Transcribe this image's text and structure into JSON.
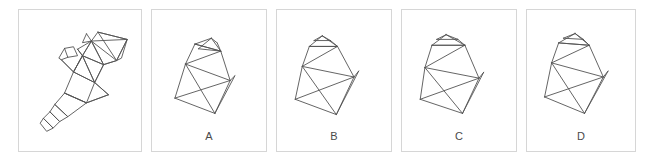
{
  "figure": {
    "kind": "spatial-reasoning-net-and-solids",
    "stroke_color": "#545454",
    "panel_border_color": "#d6d6d6",
    "background_color": "#ffffff",
    "label_color": "#4a4a4a"
  },
  "net_panel": {
    "name": "unfolded-net",
    "label": "",
    "description": "Unfolded net of a truncated pyramid with small cap, drawn as connected polygons"
  },
  "options": [
    {
      "id": "A",
      "label": "A",
      "shape": "frustum-with-cap",
      "orientation": "upright, cap tilted left, front-left face visible"
    },
    {
      "id": "B",
      "label": "B",
      "shape": "frustum-with-cap",
      "orientation": "tilted left, cap raised on top-left"
    },
    {
      "id": "C",
      "label": "C",
      "shape": "frustum-with-cap",
      "orientation": "upright, cap centered, rotated slightly"
    },
    {
      "id": "D",
      "label": "D",
      "shape": "frustum-with-cap",
      "orientation": "upright, cap tilted right, front-right face visible"
    }
  ],
  "net_geometry": {
    "stroke_width": 0.9,
    "polylines": [
      [
        [
          83,
          14
        ],
        [
          78,
          25
        ],
        [
          89,
          23
        ],
        [
          83,
          14
        ]
      ],
      [
        [
          89,
          23
        ],
        [
          97,
          12
        ],
        [
          133,
          21
        ],
        [
          89,
          23
        ]
      ],
      [
        [
          97,
          12
        ],
        [
          133,
          21
        ],
        [
          120,
          47
        ],
        [
          97,
          12
        ]
      ],
      [
        [
          133,
          21
        ],
        [
          120,
          47
        ],
        [
          126,
          44
        ],
        [
          133,
          21
        ]
      ],
      [
        [
          89,
          23
        ],
        [
          120,
          47
        ],
        [
          104,
          52
        ],
        [
          89,
          23
        ]
      ],
      [
        [
          89,
          23
        ],
        [
          104,
          52
        ],
        [
          78,
          41
        ],
        [
          89,
          23
        ]
      ],
      [
        [
          78,
          41
        ],
        [
          104,
          52
        ],
        [
          93,
          74
        ],
        [
          78,
          41
        ]
      ],
      [
        [
          78,
          41
        ],
        [
          93,
          74
        ],
        [
          67,
          61
        ],
        [
          78,
          41
        ]
      ],
      [
        [
          72,
          33
        ],
        [
          78,
          41
        ],
        [
          89,
          23
        ],
        [
          72,
          33
        ]
      ],
      [
        [
          56,
          32
        ],
        [
          67,
          30
        ],
        [
          72,
          41
        ],
        [
          60,
          43
        ],
        [
          56,
          32
        ]
      ],
      [
        [
          52,
          46
        ],
        [
          67,
          61
        ],
        [
          78,
          41
        ],
        [
          72,
          33
        ]
      ],
      [
        [
          60,
          43
        ],
        [
          52,
          46
        ],
        [
          49,
          44
        ],
        [
          56,
          32
        ]
      ],
      [
        [
          67,
          61
        ],
        [
          93,
          74
        ],
        [
          83,
          99
        ],
        [
          56,
          87
        ],
        [
          67,
          61
        ]
      ],
      [
        [
          56,
          87
        ],
        [
          83,
          99
        ],
        [
          110,
          89
        ],
        [
          93,
          74
        ]
      ],
      [
        [
          56,
          87
        ],
        [
          83,
          99
        ],
        [
          60,
          116
        ],
        [
          44,
          101
        ],
        [
          56,
          87
        ]
      ],
      [
        [
          44,
          101
        ],
        [
          60,
          116
        ],
        [
          50,
          122
        ],
        [
          38,
          110
        ],
        [
          44,
          101
        ]
      ],
      [
        [
          38,
          110
        ],
        [
          50,
          122
        ],
        [
          42,
          130
        ],
        [
          30,
          118
        ],
        [
          38,
          110
        ]
      ],
      [
        [
          30,
          118
        ],
        [
          42,
          130
        ],
        [
          34,
          134
        ],
        [
          26,
          124
        ],
        [
          30,
          118
        ]
      ],
      [
        [
          52,
          46
        ],
        [
          67,
          61
        ]
      ],
      [
        [
          67,
          61
        ],
        [
          78,
          41
        ]
      ],
      [
        [
          93,
          74
        ],
        [
          104,
          52
        ]
      ],
      [
        [
          104,
          52
        ],
        [
          120,
          47
        ]
      ],
      [
        [
          110,
          89
        ],
        [
          93,
          74
        ]
      ],
      [
        [
          83,
          99
        ],
        [
          110,
          89
        ]
      ]
    ]
  },
  "solid_geometry": {
    "stroke_width": 0.9,
    "A": {
      "lines": [
        [
          [
            25,
            46
          ],
          [
            16,
            75
          ]
        ],
        [
          [
            16,
            75
          ],
          [
            50,
            88
          ]
        ],
        [
          [
            50,
            88
          ],
          [
            63,
            60
          ]
        ],
        [
          [
            63,
            60
          ],
          [
            25,
            46
          ]
        ],
        [
          [
            25,
            46
          ],
          [
            50,
            88
          ]
        ],
        [
          [
            16,
            75
          ],
          [
            63,
            60
          ]
        ],
        [
          [
            25,
            46
          ],
          [
            33,
            29
          ]
        ],
        [
          [
            33,
            29
          ],
          [
            55,
            35
          ]
        ],
        [
          [
            55,
            35
          ],
          [
            63,
            60
          ]
        ],
        [
          [
            33,
            29
          ],
          [
            47,
            24
          ]
        ],
        [
          [
            47,
            24
          ],
          [
            55,
            35
          ]
        ],
        [
          [
            33,
            29
          ],
          [
            55,
            35
          ]
        ],
        [
          [
            36,
            33
          ],
          [
            47,
            24
          ]
        ],
        [
          [
            25,
            46
          ],
          [
            55,
            35
          ]
        ],
        [
          [
            36,
            33
          ],
          [
            55,
            35
          ]
        ],
        [
          [
            63,
            60
          ],
          [
            67,
            56
          ]
        ],
        [
          [
            50,
            88
          ],
          [
            67,
            56
          ]
        ],
        [
          [
            47,
            24
          ],
          [
            52,
            28
          ]
        ],
        [
          [
            52,
            28
          ],
          [
            55,
            35
          ]
        ]
      ]
    },
    "B": {
      "lines": [
        [
          [
            18,
            48
          ],
          [
            12,
            76
          ]
        ],
        [
          [
            12,
            76
          ],
          [
            47,
            89
          ]
        ],
        [
          [
            47,
            89
          ],
          [
            62,
            57
          ]
        ],
        [
          [
            62,
            57
          ],
          [
            18,
            48
          ]
        ],
        [
          [
            18,
            48
          ],
          [
            47,
            89
          ]
        ],
        [
          [
            12,
            76
          ],
          [
            62,
            57
          ]
        ],
        [
          [
            18,
            48
          ],
          [
            24,
            31
          ]
        ],
        [
          [
            24,
            31
          ],
          [
            48,
            31
          ]
        ],
        [
          [
            48,
            31
          ],
          [
            62,
            57
          ]
        ],
        [
          [
            24,
            31
          ],
          [
            35,
            22
          ]
        ],
        [
          [
            35,
            22
          ],
          [
            48,
            31
          ]
        ],
        [
          [
            24,
            31
          ],
          [
            48,
            31
          ]
        ],
        [
          [
            28,
            26
          ],
          [
            35,
            22
          ]
        ],
        [
          [
            18,
            48
          ],
          [
            48,
            31
          ]
        ],
        [
          [
            62,
            57
          ],
          [
            66,
            52
          ]
        ],
        [
          [
            47,
            89
          ],
          [
            66,
            52
          ]
        ],
        [
          [
            35,
            22
          ],
          [
            42,
            26
          ]
        ],
        [
          [
            42,
            26
          ],
          [
            48,
            31
          ]
        ],
        [
          [
            28,
            26
          ],
          [
            42,
            26
          ]
        ]
      ]
    },
    "C": {
      "lines": [
        [
          [
            16,
            49
          ],
          [
            12,
            76
          ]
        ],
        [
          [
            12,
            76
          ],
          [
            48,
            88
          ]
        ],
        [
          [
            48,
            88
          ],
          [
            62,
            58
          ]
        ],
        [
          [
            62,
            58
          ],
          [
            16,
            49
          ]
        ],
        [
          [
            16,
            49
          ],
          [
            48,
            88
          ]
        ],
        [
          [
            12,
            76
          ],
          [
            62,
            58
          ]
        ],
        [
          [
            16,
            49
          ],
          [
            22,
            30
          ]
        ],
        [
          [
            22,
            30
          ],
          [
            50,
            30
          ]
        ],
        [
          [
            50,
            30
          ],
          [
            62,
            58
          ]
        ],
        [
          [
            22,
            30
          ],
          [
            34,
            21
          ]
        ],
        [
          [
            34,
            21
          ],
          [
            50,
            30
          ]
        ],
        [
          [
            22,
            30
          ],
          [
            50,
            30
          ]
        ],
        [
          [
            16,
            49
          ],
          [
            50,
            30
          ]
        ],
        [
          [
            26,
            25
          ],
          [
            34,
            21
          ]
        ],
        [
          [
            62,
            58
          ],
          [
            66,
            53
          ]
        ],
        [
          [
            48,
            88
          ],
          [
            66,
            53
          ]
        ],
        [
          [
            34,
            21
          ],
          [
            44,
            25
          ]
        ],
        [
          [
            26,
            25
          ],
          [
            44,
            25
          ]
        ],
        [
          [
            44,
            25
          ],
          [
            50,
            30
          ]
        ]
      ]
    },
    "D": {
      "lines": [
        [
          [
            20,
            45
          ],
          [
            14,
            74
          ]
        ],
        [
          [
            14,
            74
          ],
          [
            48,
            88
          ]
        ],
        [
          [
            48,
            88
          ],
          [
            64,
            57
          ]
        ],
        [
          [
            64,
            57
          ],
          [
            20,
            45
          ]
        ],
        [
          [
            20,
            45
          ],
          [
            48,
            88
          ]
        ],
        [
          [
            14,
            74
          ],
          [
            64,
            57
          ]
        ],
        [
          [
            20,
            45
          ],
          [
            26,
            28
          ]
        ],
        [
          [
            26,
            28
          ],
          [
            52,
            30
          ]
        ],
        [
          [
            52,
            30
          ],
          [
            64,
            57
          ]
        ],
        [
          [
            26,
            28
          ],
          [
            40,
            20
          ]
        ],
        [
          [
            40,
            20
          ],
          [
            52,
            30
          ]
        ],
        [
          [
            26,
            28
          ],
          [
            52,
            30
          ]
        ],
        [
          [
            20,
            45
          ],
          [
            52,
            30
          ]
        ],
        [
          [
            30,
            24
          ],
          [
            40,
            20
          ]
        ],
        [
          [
            64,
            57
          ],
          [
            68,
            52
          ]
        ],
        [
          [
            48,
            88
          ],
          [
            68,
            52
          ]
        ],
        [
          [
            40,
            20
          ],
          [
            47,
            25
          ]
        ],
        [
          [
            30,
            24
          ],
          [
            47,
            25
          ]
        ],
        [
          [
            47,
            25
          ],
          [
            52,
            30
          ]
        ]
      ]
    }
  }
}
